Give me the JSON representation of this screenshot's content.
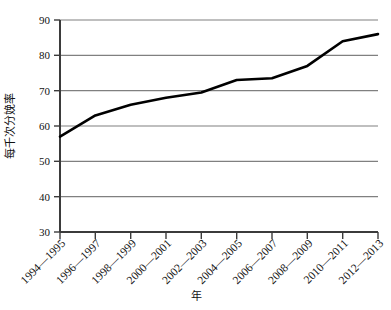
{
  "chart_data": {
    "type": "line",
    "title": "",
    "xlabel": "年",
    "ylabel": "每千次分娩率",
    "categories": [
      "1994—1995",
      "1996—1997",
      "1998—1999",
      "2000—2001",
      "2002—2003",
      "2004—2005",
      "2006—2007",
      "2008—2009",
      "2010—2011",
      "2012—2013"
    ],
    "values": [
      57,
      63,
      66,
      68,
      69.5,
      73,
      73.5,
      77,
      84,
      86
    ],
    "series": [
      {
        "name": "每千次分娩率",
        "values": [
          57,
          63,
          66,
          68,
          69.5,
          73,
          73.5,
          77,
          84,
          86
        ]
      }
    ],
    "ylim": [
      30,
      90
    ],
    "ytick_labels": [
      "30",
      "40",
      "50",
      "60",
      "70",
      "80",
      "90"
    ],
    "ytick_values": [
      30,
      40,
      50,
      60,
      70,
      80,
      90
    ],
    "grid": true,
    "legend": false,
    "line_color": "#000000",
    "grid_color": "#808080",
    "axis_color": "#3b3b3b",
    "background_color": "#ffffff"
  },
  "labels": {
    "y_axis_title": "每千次分娩率",
    "x_axis_title": "年",
    "y_0": "30",
    "y_1": "40",
    "y_2": "50",
    "y_3": "60",
    "y_4": "70",
    "y_5": "80",
    "y_6": "90",
    "x_0": "1994—1995",
    "x_1": "1996—1997",
    "x_2": "1998—1999",
    "x_3": "2000—2001",
    "x_4": "2002—2003",
    "x_5": "2004—2005",
    "x_6": "2006—2007",
    "x_7": "2008—2009",
    "x_8": "2010—2011",
    "x_9": "2012—2013"
  }
}
